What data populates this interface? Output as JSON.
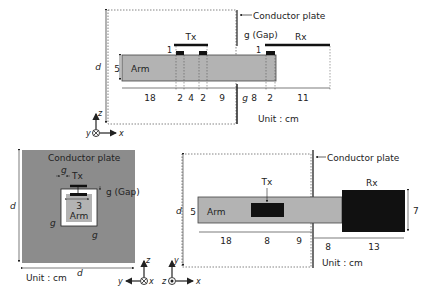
{
  "top_view": {
    "conductor_plate_label": "Conductor plate",
    "gap_label": "g (Gap)",
    "tx_label": "Tx",
    "rx_label": "Rx",
    "arm_label": "Arm",
    "d_label": "d",
    "arm_height": "5",
    "tx_offset": "1",
    "rx_offset": "1",
    "g_bottom": "g",
    "unit": "Unit : cm",
    "dimensions": [
      "18",
      "2",
      "4",
      "2",
      "9",
      "8",
      "2",
      "11"
    ],
    "axes": {
      "out_label": "y",
      "up": "z",
      "right": "x",
      "marker": "into-page"
    }
  },
  "front_view": {
    "conductor_plate_label": "Conductor plate",
    "g_top": "g",
    "tx_label": "Tx",
    "gap_label": "g (Gap)",
    "arm_width": "3",
    "arm_label": "Arm",
    "g_left": "g",
    "g_right": "g",
    "d_vertical": "d",
    "d_horizontal": "d",
    "unit": "Unit : cm",
    "axes": {
      "left": "y",
      "up": "z",
      "right_label": "x",
      "marker": "into-page"
    }
  },
  "side_view": {
    "conductor_plate_label": "Conductor plate",
    "tx_label": "Tx",
    "rx_label": "Rx",
    "arm_label": "Arm",
    "d_label": "d",
    "arm_height": "5",
    "rx_height": "7",
    "dimensions": [
      "18",
      "8",
      "9",
      "8",
      "13"
    ],
    "unit": "Unit : cm",
    "axes": {
      "left": "z",
      "up": "y",
      "right": "x",
      "marker": "out-of-page"
    }
  },
  "colors": {
    "arm": "#b3b3b3",
    "plate": "#8c8c8c",
    "antenna": "#111111",
    "line": "#222222"
  }
}
